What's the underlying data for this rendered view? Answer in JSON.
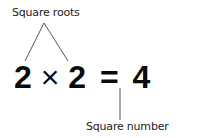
{
  "diagram": {
    "top_label": "Square roots",
    "bottom_label": "Square number",
    "equation": {
      "left_operand": "2",
      "operator": "×",
      "right_operand": "2",
      "equals": "=",
      "result": "4"
    },
    "line_color": "#444444"
  }
}
